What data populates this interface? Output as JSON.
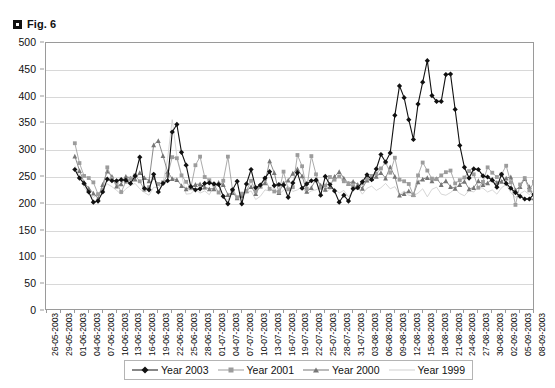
{
  "figure": {
    "caption": "Fig. 6",
    "bullet_icon": "filled-square-icon"
  },
  "chart_data": {
    "type": "line",
    "title": "Fig. 6",
    "xlabel": "",
    "ylabel": "",
    "ylim": [
      0,
      500
    ],
    "ytick_step": 50,
    "yticks": [
      500,
      450,
      400,
      350,
      300,
      250,
      200,
      150,
      100,
      50,
      0
    ],
    "grid": true,
    "grid_axis": "y",
    "legend_position": "bottom",
    "x_tick_interval_days": 3,
    "x_tick_labels": [
      "26-05-2003",
      "29-05-2003",
      "01-06-2003",
      "04-06-2003",
      "07-06-2003",
      "10-06-2003",
      "13-06-2003",
      "16-06-2003",
      "19-06-2003",
      "22-06-2003",
      "25-06-2003",
      "28-06-2003",
      "01-07-2003",
      "04-07-2003",
      "07-07-2003",
      "10-07-2003",
      "13-07-2003",
      "16-07-2003",
      "19-07-2003",
      "22-07-2003",
      "25-07-2003",
      "28-07-2003",
      "31-07-2003",
      "03-08-2003",
      "06-08-2003",
      "09-08-2003",
      "12-08-2003",
      "15-08-2003",
      "18-08-2003",
      "21-08-2003",
      "24-08-2003",
      "27-08-2003",
      "30-08-2003",
      "02-09-2003",
      "05-09-2003",
      "08-09-2003"
    ],
    "x_start": "26-05-2003",
    "x_end": "08-09-2003",
    "n_x_positions": 106,
    "data_start_index": 6,
    "series": [
      {
        "name": "Year 2003",
        "color": "#111111",
        "marker": "diamond",
        "values": [
          264,
          248,
          238,
          222,
          203,
          205,
          222,
          246,
          243,
          243,
          245,
          244,
          238,
          252,
          287,
          229,
          226,
          255,
          222,
          238,
          243,
          334,
          348,
          296,
          272,
          232,
          226,
          228,
          238,
          239,
          237,
          236,
          214,
          200,
          226,
          242,
          200,
          237,
          264,
          230,
          235,
          248,
          260,
          234,
          236,
          235,
          212,
          239,
          258,
          229,
          237,
          243,
          244,
          216,
          251,
          236,
          224,
          203,
          216,
          205,
          228,
          230,
          241,
          254,
          245,
          265,
          292,
          278,
          295,
          365,
          420,
          398,
          357,
          320,
          386,
          427,
          467,
          402,
          391,
          391,
          441,
          442,
          376,
          309,
          268,
          248,
          265,
          264,
          252,
          250,
          244,
          231,
          255,
          238,
          229,
          221,
          214,
          209,
          209,
          218,
          235,
          244,
          237
        ]
      },
      {
        "name": "Year 2001",
        "color": "#9c9c9c",
        "marker": "square",
        "values": [
          313,
          276,
          252,
          248,
          240,
          218,
          226,
          268,
          247,
          240,
          222,
          241,
          247,
          253,
          242,
          226,
          231,
          248,
          237,
          240,
          253,
          287,
          285,
          253,
          241,
          229,
          272,
          288,
          250,
          244,
          236,
          221,
          243,
          288,
          226,
          212,
          219,
          224,
          243,
          223,
          233,
          246,
          228,
          223,
          222,
          260,
          227,
          231,
          291,
          270,
          228,
          289,
          255,
          230,
          234,
          250,
          245,
          251,
          242,
          238,
          233,
          230,
          238,
          247,
          252,
          256,
          266,
          277,
          258,
          286,
          245,
          242,
          237,
          216,
          253,
          277,
          262,
          247,
          246,
          253,
          259,
          262,
          238,
          244,
          249,
          261,
          255,
          230,
          241,
          268,
          258,
          250,
          255,
          271,
          240,
          198,
          236,
          248,
          225,
          241,
          253,
          249,
          222
        ]
      },
      {
        "name": "Year 2000",
        "color": "#767676",
        "marker": "triangle",
        "values": [
          289,
          262,
          240,
          229,
          220,
          210,
          236,
          261,
          251,
          233,
          237,
          251,
          248,
          246,
          258,
          249,
          243,
          310,
          318,
          290,
          260,
          247,
          245,
          234,
          228,
          231,
          236,
          237,
          231,
          228,
          228,
          240,
          236,
          217,
          221,
          211,
          215,
          224,
          232,
          219,
          233,
          239,
          280,
          258,
          221,
          239,
          244,
          257,
          265,
          252,
          223,
          230,
          246,
          235,
          227,
          232,
          251,
          260,
          248,
          238,
          242,
          236,
          229,
          244,
          247,
          251,
          258,
          248,
          269,
          251,
          216,
          219,
          224,
          217,
          241,
          246,
          249,
          243,
          247,
          236,
          243,
          232,
          229,
          236,
          242,
          228,
          230,
          243,
          236,
          239,
          246,
          240,
          242,
          248,
          250,
          226,
          232,
          247,
          232,
          211,
          226,
          239,
          222
        ]
      },
      {
        "name": "Year 1999",
        "color": "#cfcfcf",
        "marker": "line",
        "values": [
          271,
          254,
          231,
          219,
          212,
          218,
          229,
          237,
          232,
          225,
          218,
          228,
          234,
          238,
          228,
          221,
          216,
          231,
          230,
          238,
          284,
          357,
          289,
          254,
          218,
          219,
          227,
          220,
          224,
          217,
          233,
          220,
          213,
          207,
          228,
          214,
          213,
          220,
          224,
          208,
          214,
          226,
          224,
          230,
          218,
          225,
          233,
          223,
          226,
          232,
          219,
          224,
          226,
          231,
          222,
          227,
          229,
          220,
          225,
          213,
          224,
          231,
          218,
          229,
          233,
          225,
          230,
          238,
          228,
          232,
          217,
          224,
          216,
          215,
          220,
          228,
          213,
          227,
          231,
          218,
          216,
          221,
          228,
          219,
          215,
          225,
          222,
          231,
          229,
          222,
          226,
          218,
          230,
          236,
          221,
          212,
          219,
          224,
          217,
          226,
          231,
          218,
          214
        ]
      }
    ]
  },
  "legend": {
    "items": [
      {
        "label": "Year 2003"
      },
      {
        "label": "Year 2001"
      },
      {
        "label": "Year 2000"
      },
      {
        "label": "Year 1999"
      }
    ]
  }
}
